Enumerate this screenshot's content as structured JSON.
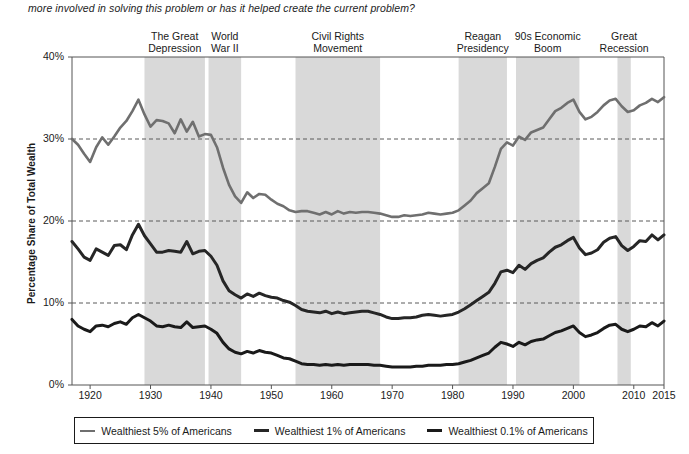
{
  "intro": {
    "text": "more involved in solving this problem or has it helped create the current problem?"
  },
  "colors": {
    "band_fill": "#d9d9d9",
    "axis": "#555555",
    "gridline": "#5a5a5a",
    "series_5pct": "#6f6f6f",
    "series_1pct": "#262626",
    "series_01pct": "#1a1a1a",
    "text": "#1a1a1a"
  },
  "axes": {
    "y_title": "Percentage Share of Total Wealth",
    "y_ticks": [
      "0%",
      "10%",
      "20%",
      "30%",
      "40%"
    ],
    "y_tick_values": [
      0,
      10,
      20,
      30,
      40
    ],
    "x_ticks": [
      "1920",
      "1930",
      "1940",
      "1950",
      "1960",
      "1970",
      "1980",
      "1990",
      "2000",
      "2010",
      "2015"
    ],
    "x_tick_values": [
      1920,
      1930,
      1940,
      1950,
      1960,
      1970,
      1980,
      1990,
      2000,
      2010,
      2015
    ]
  },
  "legend": {
    "entries": [
      {
        "label": "Wealthiest 5% of Americans",
        "key": "s5"
      },
      {
        "label": "Wealthiest 1% of Americans",
        "key": "s1"
      },
      {
        "label": "Wealthiest 0.1% of Americans",
        "key": "s01"
      }
    ]
  },
  "bands": [
    {
      "label": "The Great\nDepression",
      "start": 1929,
      "end": 1939
    },
    {
      "label": "World\nWar II",
      "start": 1939.6,
      "end": 1945
    },
    {
      "label": "Civil Rights\nMovement",
      "start": 1954,
      "end": 1968
    },
    {
      "label": "Reagan\nPresidency",
      "start": 1981,
      "end": 1989
    },
    {
      "label": "90s Economic\nBoom",
      "start": 1990.5,
      "end": 2001
    },
    {
      "label": "Great\nRecession",
      "start": 2007.3,
      "end": 2009.5
    }
  ],
  "chart_data": {
    "type": "line",
    "title": "",
    "xlabel": "",
    "ylabel": "Percentage Share of Total Wealth",
    "xlim": [
      1917,
      2015
    ],
    "ylim": [
      0,
      40
    ],
    "grid": "horizontal dashed gridlines at 10%, 20%, 30%",
    "legend_position": "bottom",
    "annotations": [
      "The Great Depression (1929-1939)",
      "World War II (1939-1945)",
      "Civil Rights Movement (1954-1968)",
      "Reagan Presidency (1981-1989)",
      "90s Economic Boom (1991-2001)",
      "Great Recession (2007-2009)"
    ],
    "x": [
      1917,
      1918,
      1919,
      1920,
      1921,
      1922,
      1923,
      1924,
      1925,
      1926,
      1927,
      1928,
      1929,
      1930,
      1931,
      1932,
      1933,
      1934,
      1935,
      1936,
      1937,
      1938,
      1939,
      1940,
      1941,
      1942,
      1943,
      1944,
      1945,
      1946,
      1947,
      1948,
      1949,
      1950,
      1951,
      1952,
      1953,
      1954,
      1955,
      1956,
      1957,
      1958,
      1959,
      1960,
      1961,
      1962,
      1963,
      1964,
      1965,
      1966,
      1967,
      1968,
      1969,
      1970,
      1971,
      1972,
      1973,
      1974,
      1975,
      1976,
      1977,
      1978,
      1979,
      1980,
      1981,
      1982,
      1983,
      1984,
      1985,
      1986,
      1987,
      1988,
      1989,
      1990,
      1991,
      1992,
      1993,
      1994,
      1995,
      1996,
      1997,
      1998,
      1999,
      2000,
      2001,
      2002,
      2003,
      2004,
      2005,
      2006,
      2007,
      2008,
      2009,
      2010,
      2011,
      2012,
      2013,
      2014,
      2015
    ],
    "series": [
      {
        "name": "Wealthiest 5% of Americans",
        "color": "#6f6f6f",
        "values": [
          30.0,
          29.3,
          28.2,
          27.2,
          29.0,
          30.2,
          29.3,
          30.3,
          31.4,
          32.2,
          33.4,
          34.8,
          33.0,
          31.5,
          32.3,
          32.2,
          31.9,
          30.7,
          32.4,
          30.9,
          32.1,
          30.3,
          30.6,
          30.5,
          29.0,
          26.5,
          24.4,
          23.0,
          22.2,
          23.5,
          22.8,
          23.3,
          23.2,
          22.6,
          22.1,
          21.8,
          21.3,
          21.1,
          21.2,
          21.2,
          21.0,
          20.8,
          21.1,
          20.8,
          21.2,
          20.9,
          21.1,
          21.0,
          21.1,
          21.1,
          21.0,
          20.9,
          20.7,
          20.5,
          20.5,
          20.7,
          20.6,
          20.7,
          20.8,
          21.0,
          20.9,
          20.8,
          20.9,
          21.0,
          21.3,
          21.9,
          22.5,
          23.4,
          24.0,
          24.6,
          26.6,
          28.8,
          29.6,
          29.2,
          30.3,
          29.9,
          30.8,
          31.1,
          31.4,
          32.4,
          33.4,
          33.8,
          34.4,
          34.8,
          33.3,
          32.4,
          32.7,
          33.3,
          34.1,
          34.7,
          34.9,
          34.0,
          33.3,
          33.5,
          34.1,
          34.4,
          34.9,
          34.5,
          35.1
        ]
      },
      {
        "name": "Wealthiest 1% of Americans",
        "color": "#262626",
        "values": [
          17.5,
          16.6,
          15.6,
          15.2,
          16.6,
          16.2,
          15.8,
          17.0,
          17.1,
          16.5,
          18.3,
          19.6,
          18.2,
          17.2,
          16.2,
          16.2,
          16.4,
          16.3,
          16.2,
          17.5,
          16.0,
          16.3,
          16.4,
          15.7,
          14.6,
          12.7,
          11.5,
          11.0,
          10.6,
          11.1,
          10.8,
          11.2,
          10.9,
          10.7,
          10.6,
          10.3,
          10.1,
          9.7,
          9.2,
          9.0,
          8.9,
          8.8,
          9.0,
          8.7,
          8.9,
          8.7,
          8.8,
          8.9,
          9.0,
          9.0,
          8.8,
          8.6,
          8.3,
          8.1,
          8.1,
          8.2,
          8.2,
          8.3,
          8.5,
          8.6,
          8.5,
          8.4,
          8.5,
          8.6,
          8.9,
          9.3,
          9.8,
          10.3,
          10.8,
          11.3,
          12.4,
          13.8,
          14.0,
          13.7,
          14.6,
          14.1,
          14.8,
          15.2,
          15.5,
          16.2,
          16.8,
          17.1,
          17.6,
          18.0,
          16.7,
          15.9,
          16.1,
          16.5,
          17.4,
          17.9,
          18.1,
          17.0,
          16.4,
          16.9,
          17.6,
          17.5,
          18.3,
          17.7,
          18.3
        ]
      },
      {
        "name": "Wealthiest 0.1% of Americans",
        "color": "#1a1a1a",
        "values": [
          8.0,
          7.2,
          6.8,
          6.5,
          7.2,
          7.3,
          7.1,
          7.5,
          7.7,
          7.4,
          8.2,
          8.6,
          8.2,
          7.8,
          7.2,
          7.1,
          7.3,
          7.1,
          7.0,
          7.7,
          7.0,
          7.1,
          7.2,
          6.8,
          6.3,
          5.2,
          4.4,
          4.0,
          3.8,
          4.1,
          3.9,
          4.2,
          4.0,
          3.9,
          3.6,
          3.3,
          3.2,
          2.9,
          2.6,
          2.5,
          2.5,
          2.4,
          2.5,
          2.4,
          2.5,
          2.4,
          2.5,
          2.5,
          2.5,
          2.5,
          2.4,
          2.4,
          2.3,
          2.2,
          2.2,
          2.2,
          2.2,
          2.3,
          2.3,
          2.4,
          2.4,
          2.4,
          2.5,
          2.5,
          2.6,
          2.8,
          3.0,
          3.3,
          3.6,
          3.9,
          4.6,
          5.2,
          5.0,
          4.7,
          5.2,
          4.9,
          5.3,
          5.5,
          5.6,
          6.0,
          6.4,
          6.6,
          6.9,
          7.2,
          6.4,
          5.9,
          6.1,
          6.4,
          6.9,
          7.3,
          7.4,
          6.8,
          6.5,
          6.8,
          7.2,
          7.1,
          7.6,
          7.2,
          7.8
        ]
      }
    ]
  }
}
